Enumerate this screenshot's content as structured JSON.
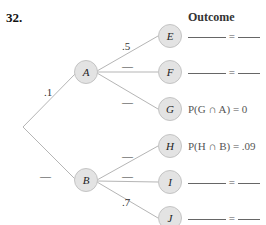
{
  "problem_number": "32.",
  "header": "Outcome",
  "branches": {
    "root_A": ".1",
    "root_B": "—",
    "A_E": ".5",
    "A_F": "—",
    "A_G": "—",
    "B_H": "—",
    "B_I": "—",
    "B_J": ".7"
  },
  "nodes": {
    "A": "A",
    "B": "B",
    "E": "E",
    "F": "F",
    "G": "G",
    "H": "H",
    "I": "I",
    "J": "J"
  },
  "outcomes": {
    "E": "= ",
    "F": "= ",
    "G": "P(G ∩ A) = 0",
    "H": "P(H ∩ B) = .09",
    "I": "= ",
    "J": "= "
  }
}
